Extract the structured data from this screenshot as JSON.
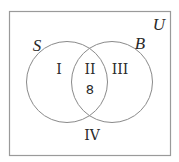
{
  "diagram": {
    "type": "venn",
    "universe_label": "U",
    "sets": [
      {
        "name": "S"
      },
      {
        "name": "B"
      }
    ],
    "regions": [
      {
        "id": "I",
        "label": "I",
        "description": "S only"
      },
      {
        "id": "II",
        "label": "II",
        "description": "S and B",
        "value": "8"
      },
      {
        "id": "III",
        "label": "III",
        "description": "B only"
      },
      {
        "id": "IV",
        "label": "IV",
        "description": "neither S nor B"
      }
    ]
  }
}
